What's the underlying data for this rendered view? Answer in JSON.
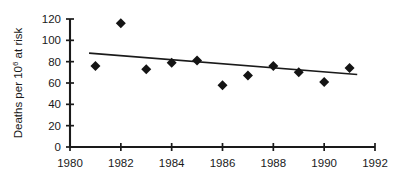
{
  "chart_data": {
    "type": "scatter",
    "title": "",
    "subtitle": "",
    "xlabel": "",
    "ylabel": "Deaths per 10⁶ at risk",
    "ylabel_parts": {
      "prefix": "Deaths per 10",
      "exponent": "6",
      "suffix": " at risk"
    },
    "xlim": [
      1980,
      1992
    ],
    "ylim": [
      0,
      120
    ],
    "grid": false,
    "legend": null,
    "x": [
      1981,
      1982,
      1983,
      1984,
      1985,
      1986,
      1987,
      1988,
      1989,
      1990,
      1991
    ],
    "values": [
      76,
      116,
      73,
      79,
      81,
      58,
      67,
      76,
      70,
      61,
      74
    ],
    "series": [
      {
        "name": "Deaths per million at risk",
        "marker": "diamond",
        "color": "#141414",
        "x": [
          1981,
          1982,
          1983,
          1984,
          1985,
          1986,
          1987,
          1988,
          1989,
          1990,
          1991
        ],
        "values": [
          76,
          116,
          73,
          79,
          81,
          58,
          67,
          76,
          70,
          61,
          74
        ]
      },
      {
        "name": "linear trend",
        "type": "line",
        "color": "#1a1a1a",
        "x": [
          1980.75,
          1991.3
        ],
        "values": [
          88,
          68
        ]
      }
    ],
    "xticks": [
      1980,
      1982,
      1984,
      1986,
      1988,
      1990,
      1992
    ],
    "xtick_labels": [
      "1980",
      "1982",
      "1984",
      "1986",
      "1988",
      "1990",
      "1992"
    ],
    "yticks": [
      0,
      20,
      40,
      60,
      80,
      100,
      120
    ],
    "ytick_labels": [
      "0",
      "20",
      "40",
      "60",
      "80",
      "100",
      "120"
    ],
    "colors": {
      "marker": "#141414",
      "axis": "#1a1a1a",
      "trend": "#1a1a1a",
      "background": "#ffffff"
    }
  }
}
